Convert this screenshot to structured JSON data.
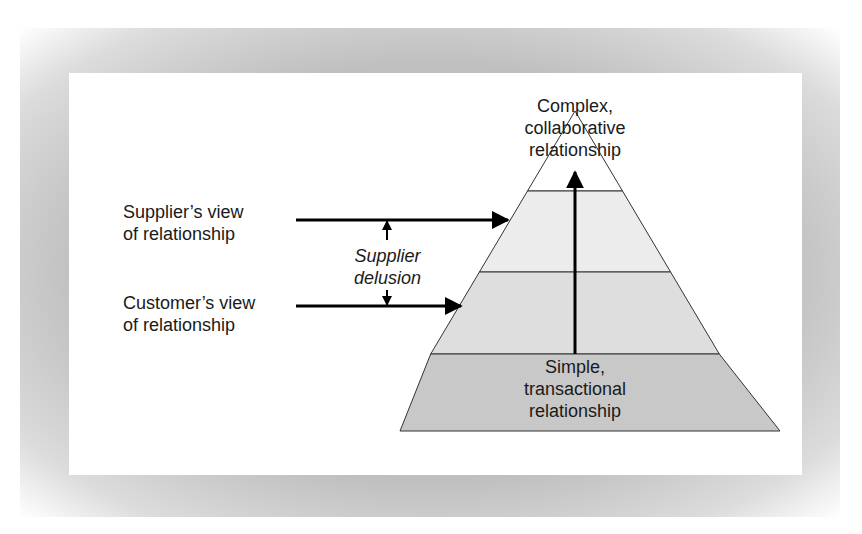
{
  "diagram": {
    "type": "pyramid",
    "top_label": "Complex,\ncollaborative\nrelationship",
    "bottom_label": "Simple,\ntransactional\nrelationship",
    "supplier_view_label": "Supplier’s view\nof relationship",
    "customer_view_label": "Customer’s view\nof relationship",
    "gap_label": "Supplier\ndelusion",
    "levels": [
      {
        "name": "top",
        "fill": "#ffffff"
      },
      {
        "name": "upper-middle",
        "fill": "#ececec"
      },
      {
        "name": "lower-middle",
        "fill": "#dedede"
      },
      {
        "name": "bottom",
        "fill": "#c8c8c8"
      }
    ],
    "colors": {
      "stroke": "#333333",
      "arrow": "#000000",
      "frame": "#c4c4c4",
      "panel": "#ffffff"
    }
  }
}
